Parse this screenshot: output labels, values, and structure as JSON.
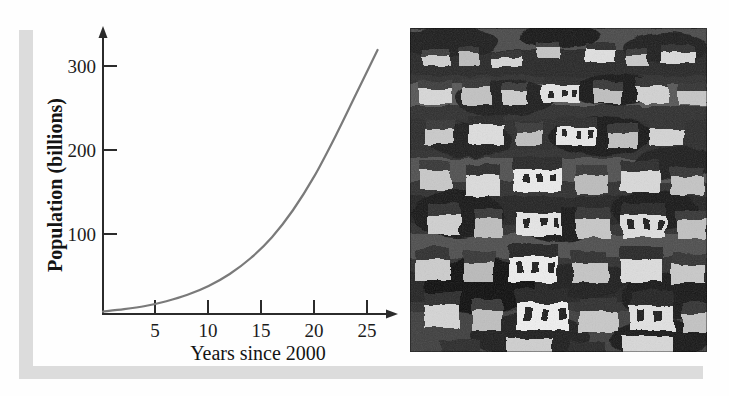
{
  "figure": {
    "background_color": "#fefefe",
    "shadow_color": "#dcdcdc",
    "ink_color": "#1a1a1a",
    "curve_color": "#7a7a7a"
  },
  "chart_data": {
    "type": "line",
    "title": "",
    "subtitle": "",
    "xlabel": "Years since 2000",
    "ylabel": "Population (billions)",
    "xlim": [
      0,
      27.5
    ],
    "ylim": [
      0,
      345
    ],
    "xticks": [
      5,
      10,
      15,
      20,
      25
    ],
    "xtick_labels": [
      "5",
      "10",
      "15",
      "20",
      "25"
    ],
    "yticks": [
      100,
      200,
      300
    ],
    "ytick_labels": [
      "100",
      "200",
      "300"
    ],
    "grid": false,
    "legend": null,
    "legend_position": "none",
    "annotations": [],
    "series": [
      {
        "name": "Population",
        "color": "#7a7a7a",
        "line_width": 2.2,
        "x": [
          0,
          1,
          2,
          3,
          4,
          5,
          6,
          7,
          8,
          9,
          10,
          11,
          12,
          13,
          14,
          15,
          16,
          17,
          18,
          19,
          20,
          21,
          22,
          23,
          24,
          25,
          26
        ],
        "values": [
          6.1,
          6.7,
          7.3,
          8.0,
          8.8,
          9.6,
          10.5,
          11.5,
          12.6,
          13.8,
          15.1,
          16.5,
          18.1,
          19.8,
          21.7,
          23.8,
          26.0,
          28.5,
          31.2,
          34.2,
          37.4,
          41.0,
          44.9,
          49.2,
          53.8,
          58.9,
          64.5
        ]
      }
    ],
    "curve_note": "exponential growth curve rising from near 0 at year 0 to about 330 billion at year 26",
    "curve_points": [
      [
        0,
        3
      ],
      [
        2,
        6
      ],
      [
        4,
        10
      ],
      [
        6,
        16
      ],
      [
        8,
        24
      ],
      [
        10,
        35
      ],
      [
        12,
        50
      ],
      [
        14,
        70
      ],
      [
        16,
        96
      ],
      [
        18,
        130
      ],
      [
        20,
        172
      ],
      [
        22,
        222
      ],
      [
        24,
        276
      ],
      [
        26,
        330
      ]
    ]
  },
  "photo": {
    "alt_name": "dense hillside informal settlement",
    "description": "Black and white photograph of densely packed houses on a steep hillside",
    "style": "monochrome halftone scan"
  }
}
